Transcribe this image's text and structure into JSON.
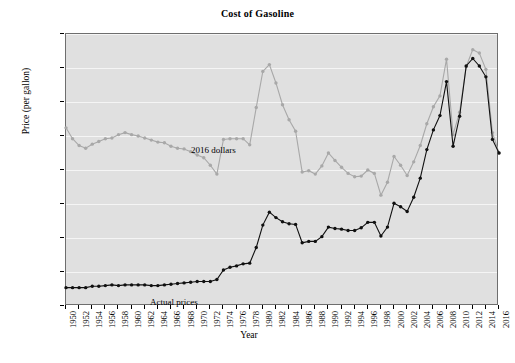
{
  "chart": {
    "title": "Cost of Gasoline",
    "xlabel": "Year",
    "ylabel": "Price (per gallon)",
    "annotations": {
      "nominal": "Actual prices",
      "real": "2016 dollars"
    }
  },
  "chart_data": {
    "type": "line",
    "title": "Cost of Gasoline",
    "xlabel": "Year",
    "ylabel": "Price (per gallon)",
    "ylim": [
      0.0,
      4.0
    ],
    "xlim": [
      1950,
      2016
    ],
    "ytick_labels": [
      "$0.00",
      "$0.50",
      "$1.00",
      "$1.50",
      "$2.00",
      "$2.50",
      "$3.00",
      "$3.50",
      "$4.00"
    ],
    "ytick_values": [
      0.0,
      0.5,
      1.0,
      1.5,
      2.0,
      2.5,
      3.0,
      3.5,
      4.0
    ],
    "grid": true,
    "legend": "inline-annotations",
    "x": [
      1950,
      1951,
      1952,
      1953,
      1954,
      1955,
      1956,
      1957,
      1958,
      1959,
      1960,
      1961,
      1962,
      1963,
      1964,
      1965,
      1966,
      1967,
      1968,
      1969,
      1970,
      1971,
      1972,
      1973,
      1974,
      1975,
      1976,
      1977,
      1978,
      1979,
      1980,
      1981,
      1982,
      1983,
      1984,
      1985,
      1986,
      1987,
      1988,
      1989,
      1990,
      1991,
      1992,
      1993,
      1994,
      1995,
      1996,
      1997,
      1998,
      1999,
      2000,
      2001,
      2002,
      2003,
      2004,
      2005,
      2006,
      2007,
      2008,
      2009,
      2010,
      2011,
      2012,
      2013,
      2014,
      2015,
      2016
    ],
    "xtick_labels": [
      "1950",
      "1952",
      "1954",
      "1956",
      "1958",
      "1960",
      "1962",
      "1964",
      "1966",
      "1968",
      "1970",
      "1972",
      "1974",
      "1976",
      "1978",
      "1980",
      "1982",
      "1984",
      "1986",
      "1988",
      "1990",
      "1992",
      "1994",
      "1996",
      "1998",
      "2000",
      "2002",
      "2004",
      "2006",
      "2008",
      "2010",
      "2012",
      "2014",
      "2016"
    ],
    "series": [
      {
        "name": "2016 dollars",
        "color": "#a8a8a8",
        "values": [
          2.62,
          2.46,
          2.36,
          2.32,
          2.38,
          2.42,
          2.46,
          2.47,
          2.52,
          2.55,
          2.52,
          2.5,
          2.47,
          2.44,
          2.41,
          2.4,
          2.35,
          2.32,
          2.31,
          2.27,
          2.22,
          2.18,
          2.07,
          1.94,
          2.45,
          2.46,
          2.46,
          2.46,
          2.37,
          2.92,
          3.45,
          3.55,
          3.28,
          2.96,
          2.74,
          2.57,
          1.97,
          1.99,
          1.94,
          2.06,
          2.25,
          2.14,
          2.04,
          1.95,
          1.9,
          1.91,
          2.0,
          1.95,
          1.63,
          1.82,
          2.2,
          2.07,
          1.92,
          2.12,
          2.36,
          2.68,
          2.93,
          3.09,
          3.63,
          2.52,
          2.85,
          3.52,
          3.77,
          3.72,
          3.48,
          2.55,
          2.25
        ]
      },
      {
        "name": "Actual prices",
        "color": "#101010",
        "values": [
          0.27,
          0.27,
          0.27,
          0.27,
          0.29,
          0.29,
          0.3,
          0.31,
          0.3,
          0.31,
          0.31,
          0.31,
          0.31,
          0.3,
          0.3,
          0.31,
          0.32,
          0.33,
          0.34,
          0.35,
          0.36,
          0.36,
          0.36,
          0.39,
          0.53,
          0.57,
          0.59,
          0.62,
          0.63,
          0.86,
          1.19,
          1.38,
          1.3,
          1.24,
          1.21,
          1.2,
          0.93,
          0.95,
          0.95,
          1.02,
          1.16,
          1.14,
          1.13,
          1.11,
          1.11,
          1.15,
          1.23,
          1.23,
          1.03,
          1.16,
          1.51,
          1.46,
          1.39,
          1.6,
          1.88,
          2.3,
          2.59,
          2.8,
          3.3,
          2.35,
          2.79,
          3.53,
          3.64,
          3.53,
          3.37,
          2.45,
          2.25
        ]
      }
    ]
  }
}
